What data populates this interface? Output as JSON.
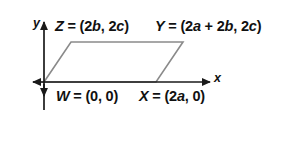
{
  "figure": {
    "background_color": "#ffffff",
    "axis_color": "#1a1a1a",
    "shape_color": "#8a8a8a"
  },
  "axes": {
    "x_label": "x",
    "y_label": "y",
    "origin_px": {
      "x": 44,
      "y": 82
    }
  },
  "labels": {
    "Z": "Z = (2b, 2c)",
    "Y": "Y = (2a + 2b, 2c)",
    "W": "W = (0, 0)",
    "X": "X = (2a, 0)"
  },
  "label_parts": {
    "Z": {
      "name": "Z",
      "eq": " = (2",
      "v1": "b",
      "mid": ", 2",
      "v2": "c",
      "close": ")"
    },
    "Y": {
      "name": "Y",
      "eq": " = (2",
      "v1": "a",
      "plus": " + 2",
      "v2": "b",
      "mid": ", 2",
      "v3": "c",
      "close": ")"
    },
    "W": {
      "name": "W",
      "eq": " = (0, 0)"
    },
    "X": {
      "name": "X",
      "eq": " = (2",
      "v1": "a",
      "close": ", 0)"
    }
  },
  "shape": {
    "type": "parallelogram",
    "vertices": [
      {
        "name": "W",
        "label": "W = (0, 0)",
        "px": {
          "x": 44,
          "y": 82
        }
      },
      {
        "name": "X",
        "label": "X = (2a, 0)",
        "px": {
          "x": 156,
          "y": 82
        }
      },
      {
        "name": "Y",
        "label": "Y = (2a + 2b, 2c)",
        "px": {
          "x": 183,
          "y": 42
        }
      },
      {
        "name": "Z",
        "label": "Z = (2b, 2c)",
        "px": {
          "x": 71,
          "y": 42
        }
      }
    ]
  }
}
